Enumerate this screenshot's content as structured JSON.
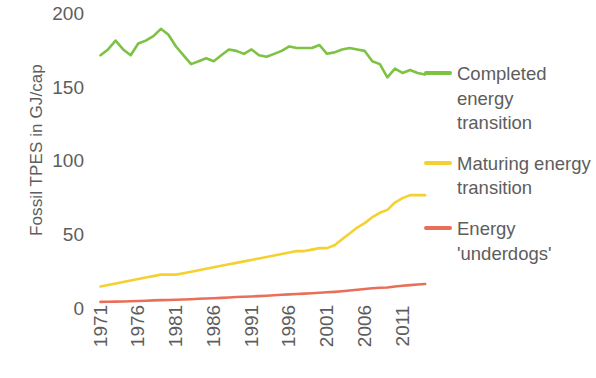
{
  "chart_data": {
    "type": "line",
    "title": "",
    "xlabel": "",
    "ylabel": "Fossil TPES in GJ/cap",
    "xlim": [
      1971,
      2014
    ],
    "ylim": [
      0,
      200
    ],
    "grid": false,
    "legend_position": "right",
    "y_ticks": [
      200,
      150,
      100,
      50,
      0
    ],
    "x_ticks": [
      1971,
      1976,
      1981,
      1986,
      1991,
      1996,
      2001,
      2006,
      2011
    ],
    "x": [
      1971,
      1972,
      1973,
      1974,
      1975,
      1976,
      1977,
      1978,
      1979,
      1980,
      1981,
      1982,
      1983,
      1984,
      1985,
      1986,
      1987,
      1988,
      1989,
      1990,
      1991,
      1992,
      1993,
      1994,
      1995,
      1996,
      1997,
      1998,
      1999,
      2000,
      2001,
      2002,
      2003,
      2004,
      2005,
      2006,
      2007,
      2008,
      2009,
      2010,
      2011,
      2012,
      2013,
      2014
    ],
    "series": [
      {
        "name": "Completed energy transition",
        "color": "#7DC242",
        "values": [
          172,
          176,
          182,
          176,
          172,
          180,
          182,
          185,
          190,
          186,
          178,
          172,
          166,
          168,
          170,
          168,
          172,
          176,
          175,
          173,
          176,
          172,
          171,
          173,
          175,
          178,
          177,
          177,
          177,
          179,
          173,
          174,
          176,
          177,
          176,
          175,
          168,
          166,
          157,
          163,
          160,
          162,
          160,
          159
        ]
      },
      {
        "name": "Maturing energy transition",
        "color": "#F5D130",
        "values": [
          15,
          16,
          17,
          18,
          19,
          20,
          21,
          22,
          23,
          23,
          23,
          24,
          25,
          26,
          27,
          28,
          29,
          30,
          31,
          32,
          33,
          34,
          35,
          36,
          37,
          38,
          39,
          39,
          40,
          41,
          41,
          43,
          47,
          51,
          55,
          58,
          62,
          65,
          67,
          72,
          75,
          77,
          77,
          77
        ]
      },
      {
        "name": "Energy 'underdogs'",
        "color": "#E8705A",
        "values": [
          4.5,
          4.6,
          4.7,
          4.8,
          4.9,
          5.1,
          5.3,
          5.5,
          5.7,
          5.8,
          5.9,
          6.1,
          6.3,
          6.6,
          6.8,
          7.0,
          7.2,
          7.5,
          7.8,
          8.0,
          8.2,
          8.4,
          8.7,
          9.0,
          9.3,
          9.6,
          9.9,
          10.1,
          10.4,
          10.7,
          11.0,
          11.3,
          11.7,
          12.2,
          12.7,
          13.2,
          13.7,
          14.1,
          14.3,
          15.0,
          15.5,
          15.9,
          16.3,
          16.6
        ]
      }
    ]
  },
  "axes": {
    "y_title": "Fossil TPES in GJ/cap",
    "y_tick_labels": [
      "200",
      "150",
      "100",
      "50",
      "0"
    ],
    "x_tick_labels": [
      "1971",
      "1976",
      "1981",
      "1986",
      "1991",
      "1996",
      "2001",
      "2006",
      "2011"
    ]
  },
  "legend": {
    "entries": [
      {
        "label": "Completed energy transition",
        "color": "#7DC242",
        "swatch_name": "legend-swatch-green"
      },
      {
        "label": "Maturing energy transition",
        "color": "#F5D130",
        "swatch_name": "legend-swatch-yellow"
      },
      {
        "label": "Energy 'underdogs'",
        "color": "#E8705A",
        "swatch_name": "legend-swatch-orange"
      }
    ]
  }
}
